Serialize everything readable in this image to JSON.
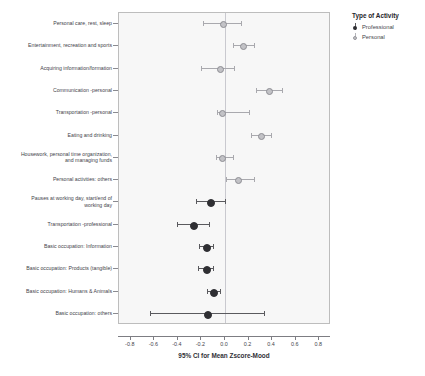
{
  "chart_data": {
    "type": "scatter",
    "title": "",
    "xlabel": "95% CI for Mean Zscore-Mood",
    "ylabel": "",
    "xlim": [
      -0.9,
      0.9
    ],
    "xticks": [
      -0.8,
      -0.6,
      -0.4,
      -0.2,
      0.0,
      0.2,
      0.4,
      0.6,
      0.8
    ],
    "xticklabels": [
      "-0.8",
      "-0.6",
      "-0.4",
      "-0.2",
      "0.0",
      "0.2",
      "0.4",
      "0.6",
      "0.8"
    ],
    "grid": false,
    "reference_line": 0.0,
    "legend": {
      "title": "Type of Activity",
      "position": "right-top",
      "entries": [
        {
          "label": "Professional",
          "color": "#2f2f33"
        },
        {
          "label": "Personal",
          "color": "#c2c2c6"
        }
      ]
    },
    "categories": [
      "Personal care, rest, sleep",
      "Entertainment, recreation and sports",
      "Acquiring information/formation",
      "Communication -personal",
      "Transportation -personal",
      "Eating and drinking",
      "Housework, personal time organization,\nand managing funds",
      "Personal activities: others",
      "Pauses at working day, start/end of\nworking day",
      "Transportation -professional",
      "Basic occupation: Information",
      "Basic occupation: Products (tangible)",
      "Basic occupation: Humans & Animals",
      "Basic occupation: others"
    ],
    "series": [
      {
        "name": "Personal",
        "color": "#c2c2c6",
        "points": [
          {
            "category": "Personal care, rest, sleep",
            "mean": -0.02,
            "lower": -0.19,
            "upper": 0.14
          },
          {
            "category": "Entertainment, recreation and sports",
            "mean": 0.15,
            "lower": 0.07,
            "upper": 0.25
          },
          {
            "category": "Acquiring information/formation",
            "mean": -0.05,
            "lower": -0.2,
            "upper": 0.08
          },
          {
            "category": "Communication -personal",
            "mean": 0.37,
            "lower": 0.26,
            "upper": 0.48
          },
          {
            "category": "Transportation -personal",
            "mean": -0.03,
            "lower": -0.07,
            "upper": 0.2
          },
          {
            "category": "Eating and drinking",
            "mean": 0.3,
            "lower": 0.22,
            "upper": 0.39
          },
          {
            "category": "Housework, personal time organization,\nand managing funds",
            "mean": -0.03,
            "lower": -0.08,
            "upper": 0.07
          },
          {
            "category": "Personal activities: others",
            "mean": 0.11,
            "lower": 0.01,
            "upper": 0.25
          }
        ]
      },
      {
        "name": "Professional",
        "color": "#2f2f33",
        "points": [
          {
            "category": "Pauses at working day, start/end of\nworking day",
            "mean": -0.13,
            "lower": -0.25,
            "upper": 0.0
          },
          {
            "category": "Transportation -professional",
            "mean": -0.27,
            "lower": -0.41,
            "upper": -0.14
          },
          {
            "category": "Basic occupation: Information",
            "mean": -0.16,
            "lower": -0.22,
            "upper": -0.1
          },
          {
            "category": "Basic occupation: Products (tangible)",
            "mean": -0.16,
            "lower": -0.23,
            "upper": -0.1
          },
          {
            "category": "Basic occupation: Humans & Animals",
            "mean": -0.1,
            "lower": -0.15,
            "upper": -0.04
          },
          {
            "category": "Basic occupation: others",
            "mean": -0.15,
            "lower": -0.64,
            "upper": 0.33
          }
        ]
      }
    ]
  }
}
